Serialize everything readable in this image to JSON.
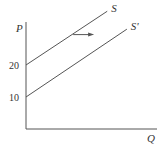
{
  "chart_data": {
    "type": "line",
    "title": "",
    "xlabel": "Q",
    "ylabel": "P",
    "ylim": [
      0,
      40
    ],
    "xlim": [
      0,
      10
    ],
    "yticks": [
      {
        "value": 10,
        "label": "10"
      },
      {
        "value": 20,
        "label": "20"
      }
    ],
    "grid": false,
    "series": [
      {
        "name": "S",
        "label": "S",
        "points": [
          [
            0,
            20
          ],
          [
            6.2,
            36.8
          ]
        ]
      },
      {
        "name": "S'",
        "label": "S'",
        "points": [
          [
            0,
            10
          ],
          [
            7.7,
            31.2
          ]
        ]
      }
    ],
    "annotations": [
      {
        "type": "arrow",
        "direction": "right",
        "from": [
          3.6,
          29.5
        ],
        "to": [
          5.2,
          29.5
        ],
        "meaning": "supply shift right"
      }
    ],
    "colors": {
      "line": "#555555",
      "axis": "#555555",
      "text": "#333333"
    }
  }
}
